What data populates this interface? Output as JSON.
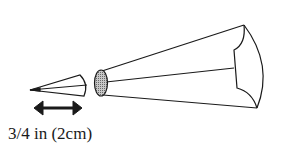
{
  "diagram": {
    "measurement_label": "3/4 in (2cm)",
    "elements": [
      {
        "name": "small-tip-cone",
        "description": "small cut-off cone tip"
      },
      {
        "name": "dimension-arrow",
        "description": "double-headed arrow indicating length"
      },
      {
        "name": "bag-opening",
        "description": "shaded elliptical opening of large cone"
      },
      {
        "name": "large-cone",
        "description": "large cone / piping bag"
      }
    ],
    "colors": {
      "stroke": "#1a1a1a",
      "fill_shade": "#a8a8a8",
      "background": "#ffffff"
    }
  }
}
